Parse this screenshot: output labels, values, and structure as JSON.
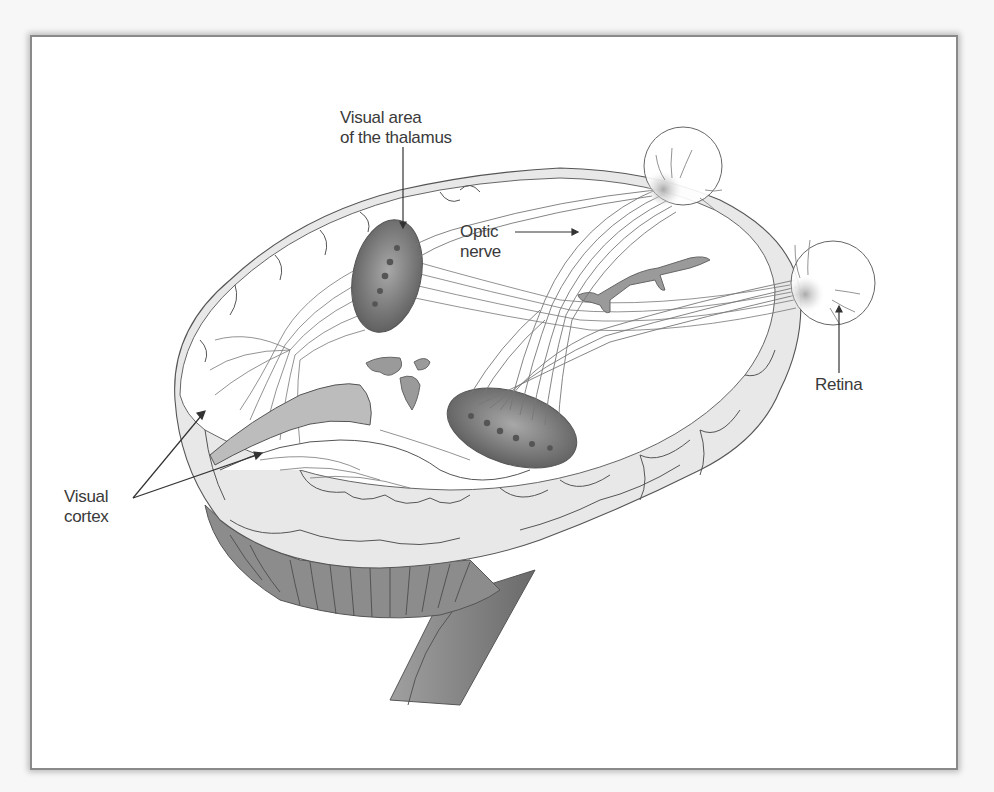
{
  "figure": {
    "labels": {
      "thalamus_line1": "Visual area",
      "thalamus_line2": "of the thalamus",
      "optic_line1": "Optic",
      "optic_line2": "nerve",
      "retina": "Retina",
      "cortex_line1": "Visual",
      "cortex_line2": "cortex"
    },
    "colors": {
      "background": "#ffffff",
      "outline": "#555555",
      "thalamus_fill": "#6e6e6e",
      "ventricle_fill": "#9a9a9a",
      "cortex_shade": "#e6e6e6",
      "cerebellum_fill": "#8c8c8c",
      "brainstem_fill": "#8a8a8a",
      "frame_border": "#8a8a8a"
    }
  },
  "bleed_text": "faint text from previous page visible above frame"
}
